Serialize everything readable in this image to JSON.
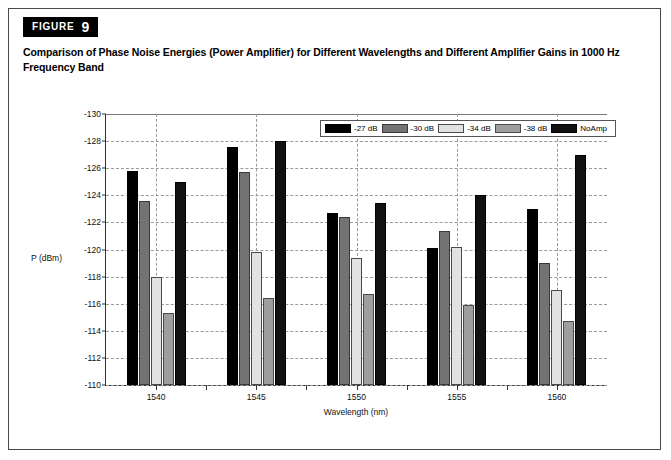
{
  "figure": {
    "badge_word": "FIGURE",
    "badge_number": "9",
    "caption": "Comparison of Phase Noise Energies (Power Amplifier) for Different Wavelengths and Different Amplifier Gains in 1000 Hz Frequency Band"
  },
  "chart_data": {
    "type": "bar",
    "title": "Comparison of Phase Noise Energies (Power Amplifier) for Different Wavelengths and Different Amplifier Gains in 1000 Hz Frequency Band",
    "xlabel": "Wavelength (nm)",
    "ylabel": "P (dBm)",
    "categories": [
      "1540",
      "1545",
      "1550",
      "1555",
      "1560"
    ],
    "ylim": [
      -110,
      -130
    ],
    "y_inverted": true,
    "yticks": [
      "-130",
      "-128",
      "-126",
      "-124",
      "-122",
      "-120",
      "-118",
      "-116",
      "-114",
      "-112",
      "-110"
    ],
    "ytick_values": [
      -130,
      -128,
      -126,
      -124,
      -122,
      -120,
      -118,
      -116,
      -114,
      -112,
      -110
    ],
    "grid": true,
    "legend_position": "top-right-inside",
    "series": [
      {
        "name": "-27 dB",
        "color": "#000000",
        "values": [
          -125.8,
          -127.6,
          -122.7,
          -120.1,
          -123.0
        ]
      },
      {
        "name": "-30 dB",
        "color": "#737373",
        "values": [
          -123.6,
          -125.7,
          -122.4,
          -121.4,
          -119.0
        ]
      },
      {
        "name": "-34 dB",
        "color": "#e2e2e2",
        "values": [
          -118.0,
          -119.8,
          -119.4,
          -120.2,
          -117.0
        ]
      },
      {
        "name": "-38 dB",
        "color": "#9e9e9e",
        "values": [
          -115.3,
          -116.4,
          -116.7,
          -115.9,
          -114.7
        ]
      },
      {
        "name": "NoAmp",
        "color": "#111111",
        "values": [
          -125.0,
          -128.0,
          -123.4,
          -124.0,
          -127.0
        ]
      }
    ]
  },
  "legend": {
    "items": [
      {
        "label": "-27 dB"
      },
      {
        "label": "-30 dB"
      },
      {
        "label": "-34 dB"
      },
      {
        "label": "-38 dB"
      },
      {
        "label": "NoAmp"
      }
    ]
  }
}
